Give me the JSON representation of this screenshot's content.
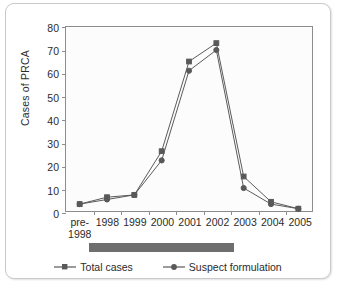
{
  "chart_data": {
    "type": "line",
    "title": "",
    "xlabel": "",
    "ylabel": "Cases of PRCA",
    "categories": [
      "pre-\n1998",
      "1998",
      "1999",
      "2000",
      "2001",
      "2002",
      "2003",
      "2004",
      "2005"
    ],
    "ylim": [
      0,
      80
    ],
    "yticks": [
      0,
      10,
      20,
      30,
      40,
      50,
      60,
      70,
      80
    ],
    "grid": false,
    "legend_position": "bottom",
    "series": [
      {
        "name": "Total cases",
        "marker": "square",
        "color": "#595959",
        "values": [
          3,
          6,
          7,
          26,
          65,
          73,
          15,
          4,
          1
        ]
      },
      {
        "name": "Suspect formulation",
        "marker": "circle",
        "color": "#595959",
        "values": [
          3,
          5,
          7,
          22,
          61,
          70,
          10,
          3,
          1
        ]
      }
    ],
    "annotations": [
      {
        "name": "period-bar",
        "type": "bar",
        "text": "",
        "color": "#6e6e6e",
        "from_category": "1998",
        "to_category": "2002"
      }
    ]
  },
  "axis": {
    "y_title": "Cases of PRCA"
  },
  "legend": {
    "items": [
      {
        "label": "Total cases"
      },
      {
        "label": "Suspect formulation"
      }
    ]
  }
}
